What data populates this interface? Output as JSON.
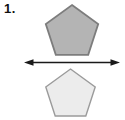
{
  "background": "#ffffff",
  "label": {
    "text": "1."
  },
  "figure": {
    "type": "reflection-diagram",
    "shapes": [
      {
        "name": "top-pentagon",
        "points": "72,5 98.2,24 88.2,54.8 55.8,54.8 45.8,24",
        "fill": "#b4b4b4",
        "stroke": "#7d7d7d",
        "stroke_width": "1.8"
      },
      {
        "name": "bottom-pentagon",
        "points": "70.5,69 95.2,87 85.8,116 55.2,116 45.8,87",
        "fill": "#ececec",
        "stroke": "#9b9b9b",
        "stroke_width": "1.4"
      }
    ],
    "mirror_line": {
      "x1": "30",
      "y1": "62.5",
      "x2": "114",
      "y2": "62.5",
      "color": "#1a1a1a",
      "stroke_width": "1.3",
      "left_head_points": "24,62.5 33.5,59.2 33.5,65.8",
      "right_head_points": "120,62.5 110.5,59.2 110.5,65.8"
    }
  }
}
